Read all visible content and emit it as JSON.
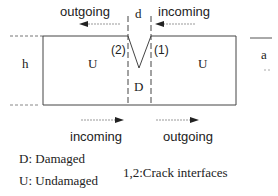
{
  "diagram": {
    "top_arrows": {
      "left_label": "outgoing",
      "right_label": "incoming",
      "gap_label": "d"
    },
    "bottom_arrows": {
      "left_label": "incoming",
      "right_label": "outgoing"
    },
    "regions": {
      "left": "U",
      "right": "U",
      "middle": "D"
    },
    "height_label": "h",
    "side_label": "a",
    "interfaces": {
      "left": "(2)",
      "right": "(1)"
    },
    "legend": {
      "damaged": "D: Damaged",
      "undamaged": "U: Undamaged",
      "interfaces": "1,2:Crack interfaces"
    }
  }
}
